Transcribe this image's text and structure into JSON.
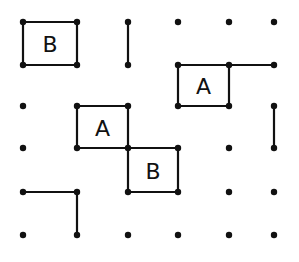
{
  "game": {
    "type": "dots-and-boxes",
    "grid": {
      "cols_x": [
        23,
        77,
        128,
        178,
        229,
        274
      ],
      "rows_y": [
        22,
        65,
        106,
        148,
        192,
        235
      ]
    },
    "colors": {
      "ink": "#111111",
      "background": "#ffffff"
    },
    "edges": [
      {
        "from": [
          0,
          0
        ],
        "to": [
          1,
          0
        ]
      },
      {
        "from": [
          0,
          1
        ],
        "to": [
          1,
          1
        ]
      },
      {
        "from": [
          0,
          0
        ],
        "to": [
          0,
          1
        ]
      },
      {
        "from": [
          1,
          0
        ],
        "to": [
          1,
          1
        ]
      },
      {
        "from": [
          2,
          0
        ],
        "to": [
          2,
          1
        ]
      },
      {
        "from": [
          3,
          1
        ],
        "to": [
          4,
          1
        ]
      },
      {
        "from": [
          4,
          1
        ],
        "to": [
          5,
          1
        ]
      },
      {
        "from": [
          3,
          2
        ],
        "to": [
          4,
          2
        ]
      },
      {
        "from": [
          3,
          1
        ],
        "to": [
          3,
          2
        ]
      },
      {
        "from": [
          4,
          1
        ],
        "to": [
          4,
          2
        ]
      },
      {
        "from": [
          5,
          2
        ],
        "to": [
          5,
          3
        ]
      },
      {
        "from": [
          1,
          2
        ],
        "to": [
          2,
          2
        ]
      },
      {
        "from": [
          1,
          3
        ],
        "to": [
          2,
          3
        ]
      },
      {
        "from": [
          1,
          2
        ],
        "to": [
          1,
          3
        ]
      },
      {
        "from": [
          2,
          2
        ],
        "to": [
          2,
          3
        ]
      },
      {
        "from": [
          2,
          3
        ],
        "to": [
          3,
          3
        ]
      },
      {
        "from": [
          2,
          4
        ],
        "to": [
          3,
          4
        ]
      },
      {
        "from": [
          2,
          3
        ],
        "to": [
          2,
          4
        ]
      },
      {
        "from": [
          3,
          3
        ],
        "to": [
          3,
          4
        ]
      },
      {
        "from": [
          0,
          4
        ],
        "to": [
          1,
          4
        ]
      },
      {
        "from": [
          1,
          4
        ],
        "to": [
          1,
          5
        ]
      }
    ],
    "boxes": [
      {
        "col": 0,
        "row": 0,
        "owner": "B"
      },
      {
        "col": 3,
        "row": 1,
        "owner": "A"
      },
      {
        "col": 1,
        "row": 2,
        "owner": "A"
      },
      {
        "col": 2,
        "row": 3,
        "owner": "B"
      }
    ]
  }
}
